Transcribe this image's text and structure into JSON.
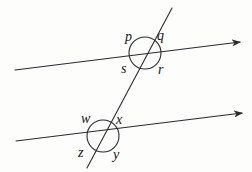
{
  "figure": {
    "kind": "geometry-diagram",
    "canvas": {
      "width": 252,
      "height": 172
    },
    "colors": {
      "background": "#fdfdfb",
      "stroke": "#2a2a30",
      "label": "#15151a"
    },
    "lines": [
      {
        "name": "upper-parallel-line",
        "x1": 15,
        "y1": 70,
        "x2": 240,
        "y2": 42,
        "arrow_end": true
      },
      {
        "name": "lower-parallel-line",
        "x1": 16,
        "y1": 141,
        "x2": 242,
        "y2": 113,
        "arrow_end": true
      },
      {
        "name": "transversal-line",
        "x1": 172,
        "y1": 8,
        "x2": 87,
        "y2": 168,
        "arrow_end": false
      }
    ],
    "intersections": [
      {
        "name": "upper-intersection",
        "cx": 145,
        "cy": 53,
        "r": 16,
        "labels": [
          {
            "id": "p",
            "text": "p",
            "x": 125,
            "y": 30
          },
          {
            "id": "q",
            "text": "q",
            "x": 157,
            "y": 29
          },
          {
            "id": "s",
            "text": "s",
            "x": 121,
            "y": 62
          },
          {
            "id": "r",
            "text": "r",
            "x": 158,
            "y": 63
          }
        ]
      },
      {
        "name": "lower-intersection",
        "cx": 103,
        "cy": 136,
        "r": 16,
        "labels": [
          {
            "id": "w",
            "text": "w",
            "x": 81,
            "y": 112
          },
          {
            "id": "x",
            "text": "x",
            "x": 116,
            "y": 113
          },
          {
            "id": "z",
            "text": "z",
            "x": 78,
            "y": 146
          },
          {
            "id": "y",
            "text": "y",
            "x": 113,
            "y": 148
          }
        ]
      }
    ]
  }
}
